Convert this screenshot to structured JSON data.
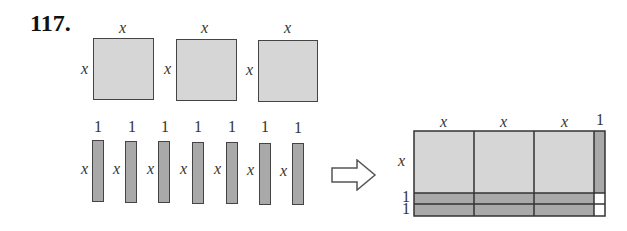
{
  "problem": {
    "number": "117."
  },
  "tiles": {
    "squares": [
      {
        "side_label": "x",
        "top_label": "x"
      },
      {
        "side_label": "x",
        "top_label": "x"
      },
      {
        "side_label": "x",
        "top_label": "x"
      }
    ],
    "bars": [
      {
        "top_label": "1",
        "side_label": "x"
      },
      {
        "top_label": "1",
        "side_label": "x"
      },
      {
        "top_label": "1",
        "side_label": "x"
      },
      {
        "top_label": "1",
        "side_label": "x"
      },
      {
        "top_label": "1",
        "side_label": "x"
      },
      {
        "top_label": "1",
        "side_label": "x"
      },
      {
        "top_label": "1",
        "side_label": "x"
      }
    ]
  },
  "arrow": {
    "direction": "right"
  },
  "result": {
    "top_labels": [
      "x",
      "x",
      "x",
      "1"
    ],
    "side_labels": [
      "x",
      "1",
      "1"
    ]
  },
  "colors": {
    "square_fill": "#d6d6d6",
    "bar_fill": "#a9a9a9",
    "unit_fill": "#ffffff",
    "stroke": "#444444"
  }
}
